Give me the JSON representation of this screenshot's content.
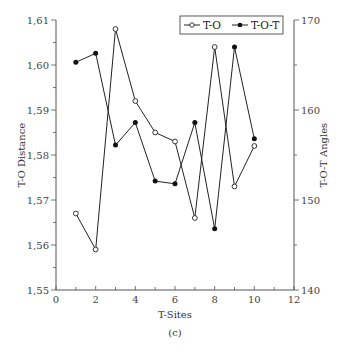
{
  "chart_data": {
    "type": "line",
    "title": "",
    "caption": "(c)",
    "xlabel": "T-Sites",
    "ylabel": "T-O Distance",
    "y2label": "T-O-T Angles",
    "xlim": [
      0,
      12
    ],
    "ylim": [
      1.55,
      1.61
    ],
    "y2lim": [
      140,
      170
    ],
    "xticks": [
      "0",
      "2",
      "4",
      "6",
      "8",
      "10",
      "12"
    ],
    "yticks": [
      "1,55",
      "1,56",
      "1,57",
      "1,58",
      "1,59",
      "1,60",
      "1,61"
    ],
    "y2ticks": [
      "140",
      "150",
      "160",
      "170"
    ],
    "grid": false,
    "legend_position": "upper right",
    "x": [
      1,
      2,
      3,
      4,
      5,
      6,
      7,
      8,
      9,
      10
    ],
    "series": [
      {
        "name": "T-O",
        "axis": "left",
        "marker": "open-circle",
        "values": [
          1.567,
          1.559,
          1.608,
          1.592,
          1.585,
          1.583,
          1.566,
          1.604,
          1.573,
          1.582
        ]
      },
      {
        "name": "T-O-T",
        "axis": "right",
        "marker": "filled-circle",
        "values": [
          165.3,
          166.3,
          156.1,
          158.6,
          152.1,
          151.8,
          158.6,
          146.8,
          167.0,
          156.8
        ]
      }
    ]
  },
  "legend": {
    "item0": "T-O",
    "item1": "T-O-T"
  }
}
